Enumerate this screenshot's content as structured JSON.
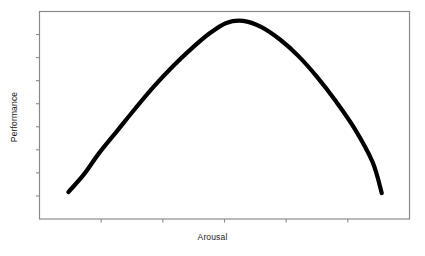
{
  "chart_data": {
    "type": "line",
    "title": "",
    "subtitle": "",
    "xlabel": "Arousal",
    "ylabel": "Performance",
    "xlim": [
      0,
      1
    ],
    "ylim": [
      0,
      1
    ],
    "grid": false,
    "legend": null,
    "legend_position": "none",
    "x_tick_labels": [],
    "y_tick_labels": [],
    "x_tick_count": 5,
    "y_tick_count": 8,
    "annotations": [],
    "series": [
      {
        "name": "Performance vs Arousal",
        "color": "#000000",
        "line_width": 4.2,
        "x": [
          0.078,
          0.12,
          0.16,
          0.21,
          0.26,
          0.31,
          0.36,
          0.41,
          0.46,
          0.505,
          0.55,
          0.6,
          0.65,
          0.7,
          0.75,
          0.8,
          0.85,
          0.9,
          0.925
        ],
        "y": [
          0.13,
          0.215,
          0.315,
          0.425,
          0.535,
          0.64,
          0.735,
          0.82,
          0.895,
          0.945,
          0.955,
          0.925,
          0.865,
          0.785,
          0.685,
          0.57,
          0.44,
          0.275,
          0.125
        ]
      }
    ]
  },
  "figure": {
    "background_color": "#ffffff",
    "frame_color": "#8a8a8a",
    "curve_color": "#000000",
    "text_color": "#1a1a1a"
  }
}
